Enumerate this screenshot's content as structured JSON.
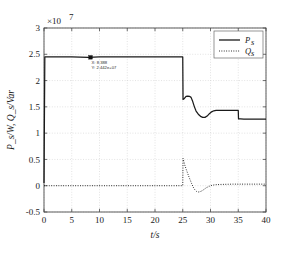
{
  "figure": {
    "caption": "",
    "exponent_label": "×10",
    "exponent_sup": "7"
  },
  "chart_data": {
    "type": "line",
    "title": "",
    "xlabel": "t/s",
    "ylabel": "P_s/W, Q_s/Var",
    "y_multiplier": "×10^7",
    "xlim": [
      0,
      40
    ],
    "ylim": [
      -0.5,
      3
    ],
    "xticks": [
      0,
      5,
      10,
      15,
      20,
      25,
      30,
      35,
      40
    ],
    "xtick_labels": [
      "0",
      "5",
      "10",
      "15",
      "20",
      "25",
      "30",
      "35",
      "40"
    ],
    "yticks": [
      -0.5,
      0,
      0.5,
      1,
      1.5,
      2,
      2.5,
      3
    ],
    "ytick_labels": [
      "-0.5",
      "0",
      "0.5",
      "1",
      "1.5",
      "2",
      "2.5",
      "3"
    ],
    "grid": true,
    "legend_position": "top-right",
    "series": [
      {
        "name": "P_s",
        "label": "P",
        "sublabel": "s",
        "style": "solid",
        "color": "#1a1a1a",
        "x": [
          0,
          0.15,
          1,
          3,
          5,
          8,
          10,
          14,
          18,
          22,
          24.6,
          24.9,
          25.0,
          25.05,
          25.3,
          25.6,
          25.9,
          26.2,
          26.5,
          26.8,
          27.1,
          27.4,
          27.8,
          28.2,
          28.6,
          29.0,
          29.4,
          29.8,
          30.2,
          30.6,
          31.0,
          31.6,
          32.5,
          33.5,
          34.6,
          34.95,
          35.0,
          35.05,
          35.4,
          36,
          37,
          38,
          39,
          40
        ],
        "y": [
          0.05,
          2.45,
          2.45,
          2.45,
          2.45,
          2.442,
          2.45,
          2.45,
          2.45,
          2.45,
          2.45,
          2.45,
          2.45,
          1.64,
          1.66,
          1.7,
          1.705,
          1.7,
          1.68,
          1.6,
          1.5,
          1.42,
          1.36,
          1.32,
          1.3,
          1.3,
          1.325,
          1.37,
          1.405,
          1.425,
          1.432,
          1.435,
          1.435,
          1.435,
          1.435,
          1.435,
          1.435,
          1.27,
          1.27,
          1.268,
          1.268,
          1.268,
          1.268,
          1.268
        ]
      },
      {
        "name": "Q_s",
        "label": "Q",
        "sublabel": "s",
        "style": "dotted",
        "color": "#1a1a1a",
        "x": [
          0,
          1,
          4,
          8,
          12,
          16,
          20,
          23,
          24.6,
          24.9,
          25.0,
          25.05,
          25.2,
          25.4,
          25.7,
          26.0,
          26.3,
          26.6,
          26.9,
          27.2,
          27.5,
          27.8,
          28.1,
          28.5,
          28.9,
          29.3,
          29.8,
          30.3,
          31,
          32,
          34,
          36,
          38,
          40
        ],
        "y": [
          0.0,
          0.0,
          0.0,
          0.0,
          0.0,
          0.0,
          0.0,
          0.0,
          0.0,
          0.0,
          0.0,
          0.52,
          0.46,
          0.38,
          0.29,
          0.2,
          0.12,
          0.04,
          -0.03,
          -0.08,
          -0.11,
          -0.12,
          -0.115,
          -0.095,
          -0.065,
          -0.035,
          -0.01,
          0.01,
          0.02,
          0.025,
          0.03,
          0.03,
          0.03,
          0.03
        ]
      }
    ],
    "datatip": {
      "x_value": 8.388,
      "y_value": 24420000,
      "x_text": "X: 8.388",
      "y_text": "Y: 2.442e+07",
      "marker": "square"
    }
  }
}
